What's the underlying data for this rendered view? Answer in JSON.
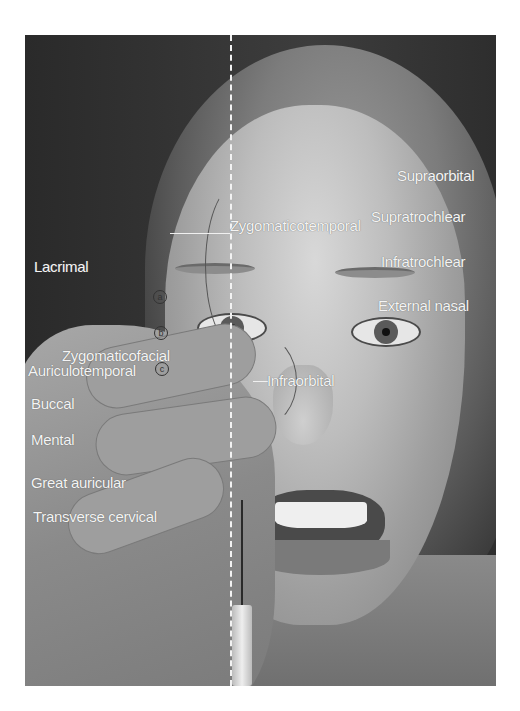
{
  "figure": {
    "labels_right": [
      {
        "text": "Supraorbital"
      },
      {
        "text": "Supratrochlear"
      },
      {
        "text": "Infratrochlear"
      },
      {
        "text": "External nasal"
      }
    ],
    "labels_center": [
      {
        "text": "Zygomaticotemporal"
      },
      {
        "text": "Infraorbital"
      }
    ],
    "labels_left": [
      {
        "text": "Lacrimal"
      },
      {
        "text": "Zygomaticofacial"
      },
      {
        "text": "Auriculotemporal"
      },
      {
        "text": "Buccal"
      },
      {
        "text": "Mental"
      },
      {
        "text": "Great auricular"
      },
      {
        "text": "Transverse cervical"
      }
    ],
    "markers": [
      "a",
      "b",
      "c"
    ]
  }
}
